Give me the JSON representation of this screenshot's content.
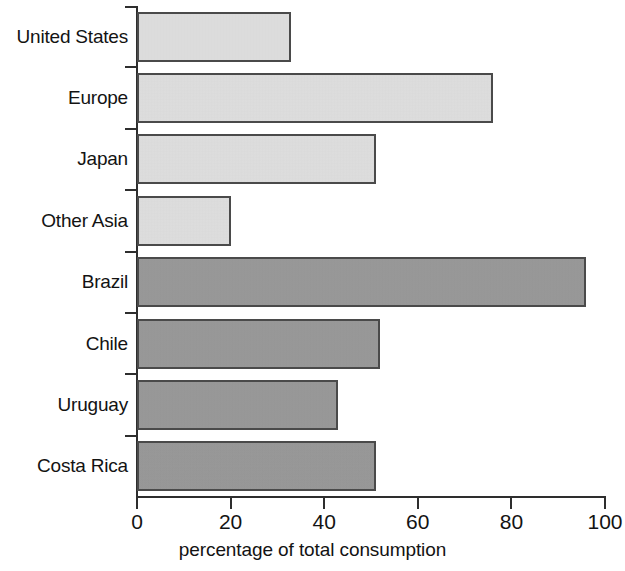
{
  "chart_data": {
    "type": "bar",
    "orientation": "horizontal",
    "title": "",
    "xlabel": "percentage of total consumption",
    "ylabel": "",
    "xlim": [
      0,
      100
    ],
    "xticks": [
      0,
      20,
      40,
      60,
      80,
      100
    ],
    "grid": false,
    "legend": null,
    "categories": [
      "United States",
      "Europe",
      "Japan",
      "Other Asia",
      "Brazil",
      "Chile",
      "Uruguay",
      "Costa Rica"
    ],
    "values": [
      33,
      76,
      51,
      20,
      96,
      52,
      43,
      51
    ],
    "bar_colors": [
      "#e2e2e2",
      "#e2e2e2",
      "#e2e2e2",
      "#e2e2e2",
      "#9b9b9b",
      "#9b9b9b",
      "#9b9b9b",
      "#9b9b9b"
    ],
    "bar_shades": [
      "light",
      "light",
      "light",
      "light",
      "dark",
      "dark",
      "dark",
      "dark"
    ],
    "border_color": "#4a4a4a",
    "axis_color": "#2e2e2e"
  },
  "axis": {
    "tick_labels": [
      "0",
      "20",
      "40",
      "60",
      "80",
      "100"
    ],
    "x_title": "percentage of total consumption"
  }
}
